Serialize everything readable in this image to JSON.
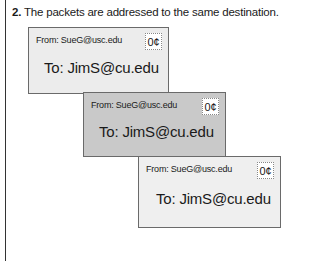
{
  "caption": {
    "number": "2.",
    "text": " The packets are addressed to the same destination."
  },
  "packets": [
    {
      "from": "From: SueG@usc.edu",
      "to": "To: JimS@cu.edu",
      "stamp": "0¢",
      "color": "#ececec"
    },
    {
      "from": "From: SueG@usc.edu",
      "to": "To: JimS@cu.edu",
      "stamp": "0¢",
      "color": "#c9c9c9"
    },
    {
      "from": "From: SueG@usc.edu",
      "to": "To: JimS@cu.edu",
      "stamp": "0¢",
      "color": "#efefef"
    }
  ]
}
